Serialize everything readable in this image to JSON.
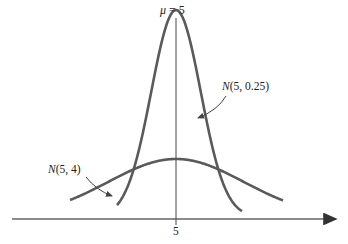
{
  "chart_data": {
    "type": "line",
    "title": "",
    "xlabel": "",
    "ylabel": "",
    "x_ticks": [
      "5"
    ],
    "mean_label": "μ = 5",
    "series": [
      {
        "name": "N(5, 0.25)",
        "mean": 5,
        "variance": 0.25,
        "std": 0.5,
        "label_position": "upper right, arrow to right flank"
      },
      {
        "name": "N(5, 4)",
        "mean": 5,
        "variance": 4,
        "std": 2,
        "label_position": "left, arrow to left flank"
      }
    ],
    "annotations": [
      "μ = 5",
      "N(5, 0.25)",
      "N(5, 4)"
    ],
    "grid": false,
    "y_axis_shown": false,
    "colors": {
      "curves": "#5a5a5a",
      "axis": "#666666",
      "text": "#222222"
    }
  },
  "labels": {
    "mu_symbol": "μ",
    "mu_eq": " = 5",
    "narrow_N": "N",
    "narrow_params": "(5, 0.25)",
    "wide_N": "N",
    "wide_params": "(5, 4)",
    "tick_5": "5"
  }
}
